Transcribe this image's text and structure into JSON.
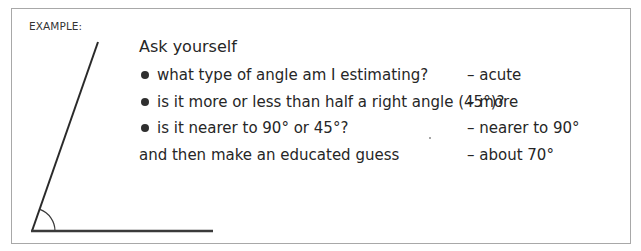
{
  "example": {
    "label": "EXAMPLE:",
    "intro": "Ask yourself",
    "questions": [
      {
        "question": "what type of angle am I estimating?",
        "answer": "– acute"
      },
      {
        "question": "is it more or less than half a right angle (45°)?",
        "answer": "– more"
      },
      {
        "question": "is it nearer to 90° or 45°?",
        "answer": "– nearer to 90°"
      }
    ],
    "conclusion": {
      "text": "and then make an educated guess",
      "answer": "– about 70°"
    },
    "diagram": {
      "type": "acute-angle",
      "vertex": [
        32,
        231
      ],
      "arm_end": [
        98,
        42
      ],
      "base_end": [
        213,
        231
      ],
      "arc_radius": 23,
      "estimated_angle_deg": 70
    }
  }
}
